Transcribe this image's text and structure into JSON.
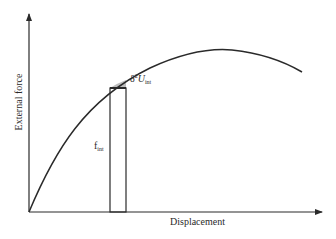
{
  "diagram": {
    "type": "force-displacement curve",
    "axes": {
      "y_label": "External force",
      "x_label": "Displacement"
    },
    "annotations": {
      "strip_label_main": "f",
      "strip_label_sub": "int",
      "increment_label_prefix": "δ",
      "increment_label_sup": "2",
      "increment_label_main": "U",
      "increment_label_sub": "int"
    },
    "colors": {
      "line": "#2a2a2a",
      "shade": "#bdbdbd",
      "background": "#ffffff"
    }
  }
}
